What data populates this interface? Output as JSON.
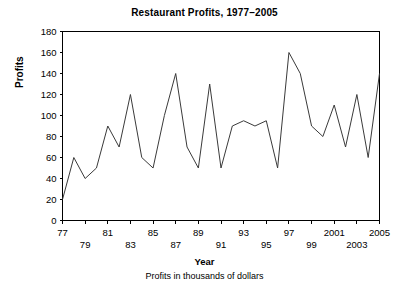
{
  "chart_data": {
    "type": "line",
    "title": "Restaurant Profits, 1977–2005",
    "xlabel": "Year",
    "ylabel": "Profits",
    "caption": "Profits in thousands of dollars",
    "grid": false,
    "legend": null,
    "xlim": [
      1977,
      2005
    ],
    "ylim": [
      0,
      180
    ],
    "ytick_step": 20,
    "yticks": [
      0,
      20,
      40,
      60,
      80,
      100,
      120,
      140,
      160,
      180
    ],
    "ytick_labels": [
      "0",
      "20",
      "40",
      "60",
      "80",
      "100",
      "120",
      "140",
      "160",
      "180"
    ],
    "xticks": [
      1977,
      1979,
      1981,
      1983,
      1985,
      1987,
      1989,
      1991,
      1993,
      1995,
      1997,
      1999,
      2001,
      2003,
      2005
    ],
    "xtick_labels_upper": [
      "77",
      "81",
      "85",
      "89",
      "93",
      "97",
      "2001",
      "2005"
    ],
    "xtick_labels_lower": [
      "79",
      "83",
      "87",
      "91",
      "95",
      "99",
      "2003"
    ],
    "xtick_label_rows": [
      {
        "year": 1977,
        "label": "77",
        "row": "upper"
      },
      {
        "year": 1979,
        "label": "79",
        "row": "lower"
      },
      {
        "year": 1981,
        "label": "81",
        "row": "upper"
      },
      {
        "year": 1983,
        "label": "83",
        "row": "lower"
      },
      {
        "year": 1985,
        "label": "85",
        "row": "upper"
      },
      {
        "year": 1987,
        "label": "87",
        "row": "lower"
      },
      {
        "year": 1989,
        "label": "89",
        "row": "upper"
      },
      {
        "year": 1991,
        "label": "91",
        "row": "lower"
      },
      {
        "year": 1993,
        "label": "93",
        "row": "upper"
      },
      {
        "year": 1995,
        "label": "95",
        "row": "lower"
      },
      {
        "year": 1997,
        "label": "97",
        "row": "upper"
      },
      {
        "year": 1999,
        "label": "99",
        "row": "lower"
      },
      {
        "year": 2001,
        "label": "2001",
        "row": "upper"
      },
      {
        "year": 2003,
        "label": "2003",
        "row": "lower"
      },
      {
        "year": 2005,
        "label": "2005",
        "row": "upper"
      }
    ],
    "x": [
      1977,
      1978,
      1979,
      1980,
      1981,
      1982,
      1983,
      1984,
      1985,
      1986,
      1987,
      1988,
      1989,
      1990,
      1991,
      1992,
      1993,
      1994,
      1995,
      1996,
      1997,
      1998,
      1999,
      2000,
      2001,
      2002,
      2003,
      2004,
      2005
    ],
    "values": [
      20,
      60,
      40,
      50,
      90,
      70,
      120,
      60,
      50,
      100,
      140,
      70,
      50,
      130,
      50,
      90,
      95,
      90,
      95,
      50,
      160,
      140,
      90,
      80,
      110,
      70,
      120,
      60,
      140
    ],
    "series": [
      {
        "name": "Profits",
        "color": "#3a3a3a",
        "values": [
          20,
          60,
          40,
          50,
          90,
          70,
          120,
          60,
          50,
          100,
          140,
          70,
          50,
          130,
          50,
          90,
          95,
          90,
          95,
          50,
          160,
          140,
          90,
          80,
          110,
          70,
          120,
          60,
          140
        ]
      }
    ],
    "axis_color": "#000000",
    "background": "#ffffff"
  }
}
